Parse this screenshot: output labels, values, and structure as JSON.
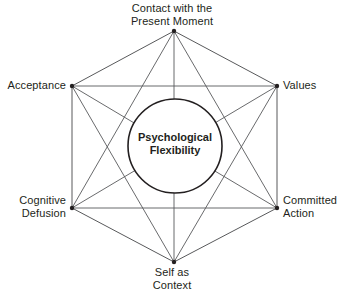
{
  "diagram": {
    "center": {
      "name": "center-core",
      "text": "Psychological\nFlexibility",
      "shape": "circle"
    },
    "colors": {
      "line": "#58595b",
      "outline": "#231f20",
      "text": "#231f20",
      "background": "#ffffff"
    },
    "nodes": [
      {
        "id": "contact-present-moment",
        "label": "Contact with the\nPresent Moment",
        "position": "top"
      },
      {
        "id": "values",
        "label": "Values",
        "position": "upper-right"
      },
      {
        "id": "committed-action",
        "label": "Committed\nAction",
        "position": "lower-right"
      },
      {
        "id": "self-as-context",
        "label": "Self as\nContext",
        "position": "bottom"
      },
      {
        "id": "cognitive-defusion",
        "label": "Cognitive\nDefusion",
        "position": "lower-left"
      },
      {
        "id": "acceptance",
        "label": "Acceptance",
        "position": "upper-left"
      }
    ],
    "geometry": {
      "vertices": [
        {
          "id": "contact-present-moment",
          "x": 174,
          "y": 31
        },
        {
          "id": "values",
          "x": 277,
          "y": 86
        },
        {
          "id": "committed-action",
          "x": 277,
          "y": 208
        },
        {
          "id": "self-as-context",
          "x": 174,
          "y": 262
        },
        {
          "id": "cognitive-defusion",
          "x": 72,
          "y": 208
        },
        {
          "id": "acceptance",
          "x": 72,
          "y": 86
        }
      ],
      "circle": {
        "cx": 175,
        "cy": 146,
        "r": 47
      }
    }
  }
}
